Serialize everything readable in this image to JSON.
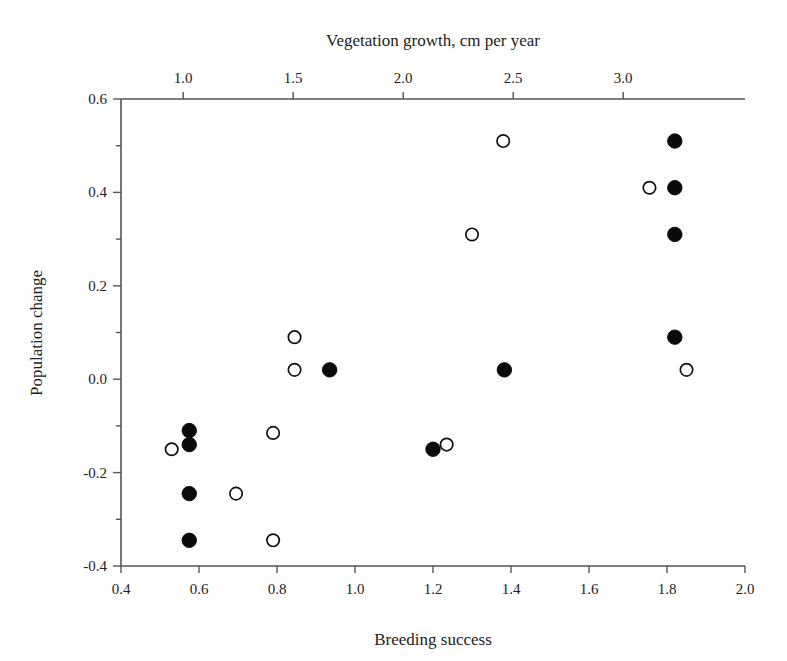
{
  "chart_data": {
    "type": "scatter",
    "title": "",
    "xlabel": "Breeding success",
    "ylabel": "Population change",
    "x2label": "Vegetation growth, cm per year",
    "xlim": [
      0.4,
      2.0
    ],
    "ylim": [
      -0.4,
      0.6
    ],
    "x2lim": [
      0.7172,
      3.5536
    ],
    "grid": false,
    "legend": "none",
    "xticks": [
      "0.4",
      "0.6",
      "0.8",
      "1.0",
      "1.2",
      "1.4",
      "1.6",
      "1.8",
      "2.0"
    ],
    "xtick_values": [
      0.4,
      0.6,
      0.8,
      1.0,
      1.2,
      1.4,
      1.6,
      1.8,
      2.0
    ],
    "yticks": [
      "0.6",
      "0.4",
      "0.2",
      "0.0",
      "-0.2",
      "-0.4"
    ],
    "ytick_values": [
      0.6,
      0.4,
      0.2,
      0.0,
      -0.2,
      -0.4
    ],
    "x2ticks": [
      "1.0",
      "1.5",
      "2.0",
      "2.5",
      "3.0"
    ],
    "x2tick_values": [
      1.0,
      1.5,
      2.0,
      2.5,
      3.0
    ],
    "yminor_values": [
      0.5,
      0.3,
      0.1,
      -0.1,
      -0.3
    ],
    "series": [
      {
        "name": "Breeding success (filled)",
        "marker": "filled-circle",
        "color": "#0b0b0b",
        "axis": "bottom",
        "points": [
          {
            "x": 1.82,
            "y": 0.51
          },
          {
            "x": 1.82,
            "y": 0.41
          },
          {
            "x": 1.82,
            "y": 0.31
          },
          {
            "x": 1.82,
            "y": 0.09
          },
          {
            "x": 1.383,
            "y": 0.02
          },
          {
            "x": 0.935,
            "y": 0.02
          },
          {
            "x": 1.2,
            "y": -0.15
          },
          {
            "x": 0.575,
            "y": -0.11
          },
          {
            "x": 0.575,
            "y": -0.14
          },
          {
            "x": 0.575,
            "y": -0.245
          },
          {
            "x": 0.575,
            "y": -0.345
          }
        ]
      },
      {
        "name": "Vegetation growth (open)",
        "marker": "open-circle",
        "color": "#111111",
        "axis": "top",
        "points": [
          {
            "x": 1.755,
            "y": 0.41
          },
          {
            "x": 2.475,
            "y": 0.51
          },
          {
            "x": 2.3,
            "y": 0.31
          },
          {
            "x": 1.845,
            "y": 0.09
          },
          {
            "x": 1.845,
            "y": 0.02
          },
          {
            "x": 3.175,
            "y": 0.02
          },
          {
            "x": 1.565,
            "y": -0.115
          },
          {
            "x": 1.235,
            "y": -0.14
          },
          {
            "x": 1.205,
            "y": -0.15
          },
          {
            "x": 1.405,
            "y": -0.245
          },
          {
            "x": 1.565,
            "y": -0.345
          },
          {
            "x": 0.98,
            "y": -0.15
          }
        ]
      }
    ],
    "open_points_bottom_axis": [
      {
        "x": 1.755,
        "y": 0.41
      },
      {
        "x": 1.38,
        "y": 0.51
      },
      {
        "x": 1.3,
        "y": 0.31
      },
      {
        "x": 0.845,
        "y": 0.09
      },
      {
        "x": 0.845,
        "y": 0.02
      },
      {
        "x": 1.85,
        "y": 0.02
      },
      {
        "x": 0.79,
        "y": -0.115
      },
      {
        "x": 1.235,
        "y": -0.14
      },
      {
        "x": 0.53,
        "y": -0.15
      },
      {
        "x": 0.695,
        "y": -0.245
      },
      {
        "x": 0.79,
        "y": -0.345
      }
    ]
  },
  "axes": {
    "top_title": "Vegetation growth, cm per year",
    "bottom_title": "Breeding success",
    "left_title": "Population change"
  }
}
